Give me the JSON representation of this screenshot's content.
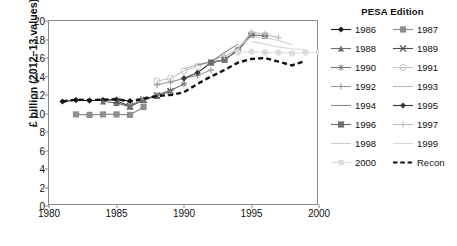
{
  "chart_data": {
    "type": "line",
    "title": "",
    "xlabel": "",
    "ylabel": "£ billion (2012–13 values)",
    "xlim": [
      1980,
      2000
    ],
    "ylim": [
      0,
      20
    ],
    "xticks": [
      1980,
      1985,
      1990,
      1995,
      2000
    ],
    "yticks": [
      0,
      2,
      4,
      6,
      8,
      10,
      12,
      14,
      16,
      18,
      20
    ],
    "grid": false,
    "legend_title": "PESA Edition",
    "legend_position": "right",
    "series": [
      {
        "name": "1986",
        "marker": "diamond",
        "color": "#1a1a1a",
        "dash": "solid",
        "x": [
          1981,
          1982,
          1983,
          1984,
          1985,
          1986
        ],
        "values": [
          11.3,
          11.45,
          11.4,
          11.45,
          11.5,
          11.35
        ]
      },
      {
        "name": "1987",
        "marker": "square",
        "color": "#8f8f8f",
        "dash": "solid",
        "x": [
          1982,
          1983,
          1984,
          1985,
          1986,
          1987
        ],
        "values": [
          9.9,
          9.85,
          9.9,
          9.9,
          9.85,
          10.7
        ]
      },
      {
        "name": "1988",
        "marker": "triangle",
        "color": "#6e6e6e",
        "dash": "solid",
        "x": [
          1984,
          1985,
          1986,
          1987,
          1988
        ],
        "values": [
          11.3,
          11.15,
          10.75,
          11.45,
          11.9
        ]
      },
      {
        "name": "1989",
        "marker": "x",
        "color": "#4d4d4d",
        "dash": "solid",
        "x": [
          1985,
          1986,
          1987,
          1988,
          1989
        ],
        "values": [
          11.35,
          10.8,
          11.5,
          11.95,
          12.4
        ]
      },
      {
        "name": "1990",
        "marker": "asterisk",
        "color": "#777777",
        "dash": "solid",
        "x": [
          1986,
          1987,
          1988,
          1989,
          1990
        ],
        "values": [
          10.8,
          11.5,
          12.0,
          12.5,
          13.2
        ]
      },
      {
        "name": "1991",
        "marker": "circle-open",
        "color": "#c7c7c7",
        "dash": "solid",
        "x": [
          1988,
          1989,
          1990,
          1991
        ],
        "values": [
          13.5,
          13.8,
          14.6,
          15.1
        ]
      },
      {
        "name": "1992",
        "marker": "plus",
        "color": "#9a9a9a",
        "dash": "solid",
        "x": [
          1988,
          1989,
          1990,
          1991,
          1992
        ],
        "values": [
          13.1,
          13.4,
          13.8,
          14.1,
          14.7
        ]
      },
      {
        "name": "1993",
        "marker": "none",
        "color": "#b5b5b5",
        "dash": "solid",
        "x": [
          1990,
          1991,
          1992,
          1993
        ],
        "values": [
          14.8,
          15.3,
          15.6,
          16.3
        ]
      },
      {
        "name": "1994",
        "marker": "none",
        "color": "#8a8a8a",
        "dash": "solid",
        "x": [
          1991,
          1992,
          1993,
          1994
        ],
        "values": [
          15.2,
          15.6,
          16.6,
          17.5
        ]
      },
      {
        "name": "1995",
        "marker": "diamond",
        "color": "#3a3a3a",
        "dash": "solid",
        "x": [
          1990,
          1991,
          1992,
          1993,
          1994,
          1995
        ],
        "values": [
          13.8,
          14.4,
          15.5,
          15.8,
          16.9,
          18.6
        ]
      },
      {
        "name": "1996",
        "marker": "square",
        "color": "#707070",
        "dash": "solid",
        "x": [
          1992,
          1993,
          1994,
          1995,
          1996
        ],
        "values": [
          15.5,
          15.8,
          16.8,
          18.5,
          18.4
        ]
      },
      {
        "name": "1997",
        "marker": "plus-light",
        "color": "#bdbdbd",
        "dash": "solid",
        "x": [
          1993,
          1994,
          1995,
          1996,
          1997
        ],
        "values": [
          16.2,
          17.0,
          18.8,
          18.6,
          18.2
        ]
      },
      {
        "name": "1998",
        "marker": "none",
        "color": "#cfcfcf",
        "dash": "solid",
        "x": [
          1994,
          1995,
          1996,
          1997,
          1998
        ],
        "values": [
          17.2,
          18.3,
          18.2,
          17.9,
          17.4
        ]
      },
      {
        "name": "1999",
        "marker": "none",
        "color": "#d8d8d8",
        "dash": "solid",
        "x": [
          1995,
          1996,
          1997,
          1998,
          1999
        ],
        "values": [
          17.8,
          17.5,
          17.2,
          17.0,
          16.9
        ]
      },
      {
        "name": "2000",
        "marker": "circle",
        "color": "#dcdcdc",
        "dash": "solid",
        "x": [
          1994,
          1995,
          1996,
          1997,
          1998,
          1999,
          2000
        ],
        "values": [
          16.6,
          16.7,
          16.6,
          16.6,
          16.5,
          16.6,
          16.6
        ]
      },
      {
        "name": "Recon",
        "marker": "none",
        "color": "#111111",
        "dash": "dashed",
        "x": [
          1981,
          1982,
          1983,
          1984,
          1985,
          1986,
          1987,
          1988,
          1989,
          1990,
          1991,
          1992,
          1993,
          1994,
          1995,
          1996,
          1997,
          1998,
          1999
        ],
        "values": [
          11.3,
          11.5,
          11.45,
          11.5,
          11.55,
          11.3,
          11.6,
          11.9,
          12.0,
          12.3,
          13.2,
          14.0,
          14.7,
          15.5,
          15.9,
          16.0,
          15.6,
          15.2,
          15.7
        ]
      }
    ]
  },
  "axes": {
    "y_title": "£ billion (2012–13 values)",
    "y_ticks": [
      "0",
      "2",
      "4",
      "6",
      "8",
      "10",
      "12",
      "14",
      "16",
      "18",
      "20"
    ],
    "x_ticks": [
      "1980",
      "1985",
      "1990",
      "1995",
      "2000"
    ]
  },
  "legend": {
    "title": "PESA Edition",
    "items": [
      {
        "label": "1986"
      },
      {
        "label": "1987"
      },
      {
        "label": "1988"
      },
      {
        "label": "1989"
      },
      {
        "label": "1990"
      },
      {
        "label": "1991"
      },
      {
        "label": "1992"
      },
      {
        "label": "1993"
      },
      {
        "label": "1994"
      },
      {
        "label": "1995"
      },
      {
        "label": "1996"
      },
      {
        "label": "1997"
      },
      {
        "label": "1998"
      },
      {
        "label": "1999"
      },
      {
        "label": "2000"
      },
      {
        "label": "Recon"
      }
    ]
  }
}
